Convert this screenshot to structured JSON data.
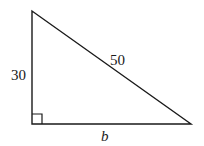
{
  "figure": {
    "type": "right-triangle",
    "stroke_color": "#1a1a1a",
    "vertices": {
      "top": [
        32,
        11
      ],
      "right_angle": [
        32,
        124
      ],
      "bottom_right": [
        191,
        124
      ]
    },
    "labels": {
      "left_leg": "30",
      "hypotenuse": "50",
      "base": "b"
    },
    "right_angle_marker": true
  }
}
